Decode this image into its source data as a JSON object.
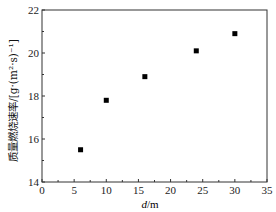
{
  "chart_data": {
    "type": "scatter",
    "title": "",
    "xlabel": "d/m",
    "ylabel": "质量燃烧速率/[g·(m²·s)⁻¹]",
    "xlim": [
      0,
      35
    ],
    "ylim": [
      14,
      22
    ],
    "xticks": [
      0,
      5,
      10,
      15,
      20,
      25,
      30,
      35
    ],
    "yticks": [
      14,
      16,
      18,
      20,
      22
    ],
    "grid": false,
    "legend": null,
    "marker": "square",
    "color": "#000000",
    "series": [
      {
        "name": "质量燃烧速率",
        "x": [
          6,
          10,
          16,
          24,
          30
        ],
        "y": [
          15.5,
          17.8,
          18.9,
          20.1,
          20.9
        ]
      }
    ]
  },
  "labels": {
    "xlabel_italic": "d",
    "xlabel_unit": "/m",
    "ylabel": "质量燃烧速率/[g·(m²·s)⁻¹]"
  }
}
